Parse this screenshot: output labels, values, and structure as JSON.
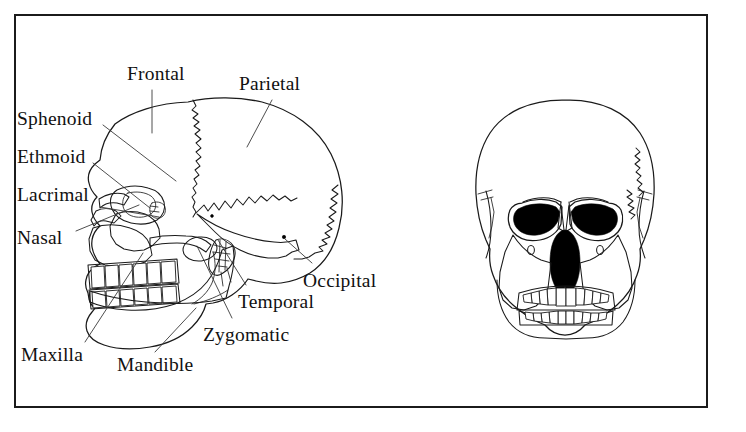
{
  "figure": {
    "frame": {
      "border_color": "#1b1b1b",
      "background": "#ffffff"
    },
    "line_color": "#1a1a1a",
    "fill_color": "#ffffff",
    "shadow_color": "#000000"
  },
  "views": {
    "lateral": {
      "name": "lateral-skull-view"
    },
    "anterior": {
      "name": "anterior-skull-view"
    }
  },
  "labels": [
    {
      "id": "frontal",
      "text": "Frontal",
      "x": 127,
      "y": 64,
      "leader": [
        [
          152,
          90
        ],
        [
          152,
          133
        ]
      ]
    },
    {
      "id": "parietal",
      "text": "Parietal",
      "x": 239,
      "y": 74,
      "leader": [
        [
          272,
          100
        ],
        [
          247,
          147
        ]
      ]
    },
    {
      "id": "sphenoid",
      "text": "Sphenoid",
      "x": 17,
      "y": 109,
      "leader": [
        [
          103,
          125
        ],
        [
          176,
          181
        ]
      ]
    },
    {
      "id": "ethmoid",
      "text": "Ethmoid",
      "x": 17,
      "y": 147,
      "leader": [
        [
          93,
          163
        ],
        [
          150,
          208
        ]
      ]
    },
    {
      "id": "lacrimal",
      "text": "Lacrimal",
      "x": 17,
      "y": 185,
      "leader": [
        [
          100,
          207
        ],
        [
          159,
          217
        ]
      ]
    },
    {
      "id": "nasal",
      "text": "Nasal",
      "x": 17,
      "y": 228,
      "leader": [
        [
          76,
          231
        ],
        [
          139,
          205
        ]
      ]
    },
    {
      "id": "maxilla",
      "text": "Maxilla",
      "x": 21,
      "y": 345,
      "leader": [
        [
          85,
          342
        ],
        [
          143,
          253
        ]
      ]
    },
    {
      "id": "mandible",
      "text": "Mandible",
      "x": 117,
      "y": 355,
      "leader": [
        [
          155,
          352
        ],
        [
          196,
          308
        ]
      ]
    },
    {
      "id": "zygomatic",
      "text": "Zygomatic",
      "x": 203,
      "y": 325,
      "leader": [
        [
          232,
          318
        ],
        [
          197,
          246
        ]
      ]
    },
    {
      "id": "temporal",
      "text": "Temporal",
      "x": 238,
      "y": 292,
      "leader": [
        [
          246,
          285
        ],
        [
          218,
          240
        ]
      ]
    },
    {
      "id": "occipital",
      "text": "Occipital",
      "x": 303,
      "y": 271,
      "leader": [
        [
          312,
          263
        ],
        [
          285,
          239
        ]
      ]
    }
  ]
}
